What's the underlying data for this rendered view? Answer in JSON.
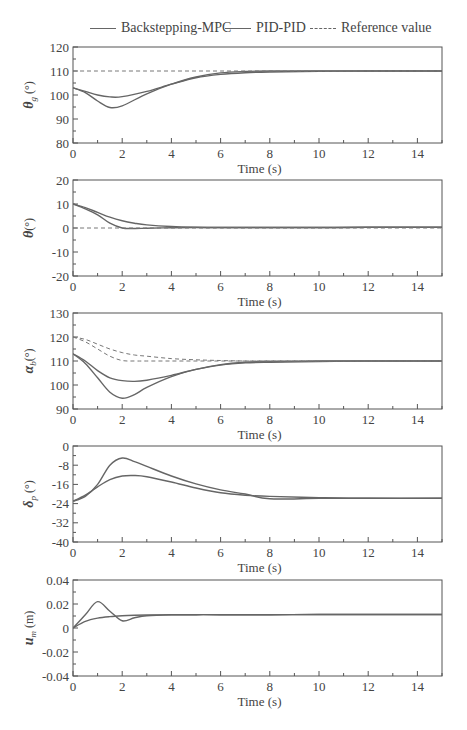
{
  "legend": {
    "items": [
      {
        "label": "Backstepping-MPC",
        "style": "solid"
      },
      {
        "label": "PID-PID",
        "style": "solid"
      },
      {
        "label": "Reference value",
        "style": "dashed"
      }
    ]
  },
  "colors": {
    "line": "#666666",
    "axis": "#555555",
    "text": "#444444"
  },
  "chart_data": [
    {
      "type": "line",
      "title": "",
      "xlabel": "Time (s)",
      "ylabel": "θg (°)",
      "xlim": [
        0,
        15
      ],
      "ylim": [
        80,
        120
      ],
      "xticks": [
        0,
        2,
        4,
        6,
        8,
        10,
        12,
        14
      ],
      "yticks": [
        80,
        90,
        100,
        110,
        120
      ],
      "grid": false,
      "x": [
        0,
        0.5,
        1,
        1.5,
        2,
        3,
        4,
        5,
        6,
        7,
        8,
        10,
        12,
        15
      ],
      "series": [
        {
          "name": "Backstepping-MPC",
          "style": "solid",
          "values": [
            103,
            101.5,
            100,
            99.2,
            99.3,
            101.5,
            104.5,
            107.2,
            108.6,
            109.3,
            109.6,
            109.9,
            110,
            110
          ]
        },
        {
          "name": "PID-PID",
          "style": "solid",
          "values": [
            103,
            101,
            97.5,
            94.8,
            95.5,
            100.5,
            104.5,
            107.5,
            109.2,
            109.8,
            110,
            110,
            110,
            110
          ]
        },
        {
          "name": "Reference value",
          "style": "dashed",
          "values": [
            110,
            110,
            110,
            110,
            110,
            110,
            110,
            110,
            110,
            110,
            110,
            110,
            110,
            110
          ]
        }
      ]
    },
    {
      "type": "line",
      "title": "",
      "xlabel": "Time (s)",
      "ylabel": "θ(°)",
      "xlim": [
        0,
        15
      ],
      "ylim": [
        -20,
        20
      ],
      "xticks": [
        0,
        2,
        4,
        6,
        8,
        10,
        12,
        14
      ],
      "yticks": [
        -20,
        -10,
        0,
        10,
        20
      ],
      "grid": false,
      "x": [
        0,
        0.5,
        1,
        1.5,
        2,
        2.5,
        3,
        4,
        5,
        6,
        8,
        10,
        12,
        15
      ],
      "series": [
        {
          "name": "Backstepping-MPC",
          "style": "solid",
          "values": [
            10,
            8.5,
            6.5,
            4.5,
            3,
            2,
            1.3,
            0.6,
            0.3,
            0.2,
            0.2,
            0.2,
            0.3,
            0.3
          ]
        },
        {
          "name": "PID-PID",
          "style": "solid",
          "values": [
            10,
            8,
            5.5,
            2,
            0,
            -0.2,
            -0.1,
            0.1,
            0.2,
            0.2,
            0.2,
            0.2,
            0.3,
            0.3
          ]
        },
        {
          "name": "Reference value",
          "style": "dashed",
          "values": [
            0,
            0,
            0,
            0,
            0,
            0,
            0,
            0,
            0,
            0,
            0,
            0,
            0,
            0
          ]
        }
      ]
    },
    {
      "type": "line",
      "title": "",
      "xlabel": "Time (s)",
      "ylabel": "αb(°)",
      "xlim": [
        0,
        15
      ],
      "ylim": [
        90,
        130
      ],
      "xticks": [
        0,
        2,
        4,
        6,
        8,
        10,
        12,
        14
      ],
      "yticks": [
        90,
        100,
        110,
        120,
        130
      ],
      "grid": false,
      "x": [
        0,
        0.5,
        1,
        1.5,
        2,
        2.5,
        3,
        4,
        5,
        6,
        7,
        8,
        10,
        12,
        15
      ],
      "series": [
        {
          "name": "Backstepping-MPC",
          "style": "solid",
          "values": [
            113,
            110,
            106,
            103,
            101.8,
            101.5,
            102,
            104,
            106.5,
            108.3,
            109.2,
            109.5,
            109.8,
            110,
            110
          ]
        },
        {
          "name": "PID-PID",
          "style": "solid",
          "values": [
            113,
            109,
            103,
            97,
            94.5,
            96,
            99,
            103.5,
            106.5,
            108.5,
            109.5,
            109.8,
            110,
            110,
            110
          ]
        },
        {
          "name": "Reference value (Backstepping-MPC)",
          "style": "dashed",
          "values": [
            120,
            119,
            117,
            115,
            113.5,
            112.5,
            112,
            111,
            110.5,
            110.2,
            110,
            110,
            110,
            110,
            110
          ]
        },
        {
          "name": "Reference value (PID-PID)",
          "style": "dashed",
          "values": [
            120,
            118,
            115,
            112,
            110.2,
            110,
            110,
            110,
            110,
            110,
            110,
            110,
            110,
            110,
            110
          ]
        }
      ]
    },
    {
      "type": "line",
      "title": "",
      "xlabel": "Time (s)",
      "ylabel": "δp (°)",
      "xlim": [
        0,
        15
      ],
      "ylim": [
        -40,
        0
      ],
      "xticks": [
        0,
        2,
        4,
        6,
        8,
        10,
        12,
        14
      ],
      "yticks": [
        -40,
        -32,
        -24,
        -16,
        -8,
        0
      ],
      "grid": false,
      "x": [
        0,
        0.5,
        1,
        1.5,
        2,
        2.5,
        3,
        4,
        5,
        6,
        7,
        8,
        10,
        12,
        15
      ],
      "series": [
        {
          "name": "Backstepping-MPC",
          "style": "solid",
          "values": [
            -23,
            -20.5,
            -17,
            -14,
            -12.5,
            -12.3,
            -12.8,
            -15,
            -17.5,
            -19.5,
            -20.5,
            -21,
            -21.5,
            -21.8,
            -21.8
          ]
        },
        {
          "name": "PID-PID",
          "style": "solid",
          "values": [
            -23,
            -21,
            -16,
            -8,
            -5,
            -6.5,
            -8.5,
            -12.5,
            -15.8,
            -18.3,
            -20,
            -22,
            -21.8,
            -21.8,
            -21.8
          ]
        }
      ]
    },
    {
      "type": "line",
      "title": "",
      "xlabel": "Time (s)",
      "ylabel": "um (m)",
      "xlim": [
        0,
        15
      ],
      "ylim": [
        -0.04,
        0.04
      ],
      "xticks": [
        0,
        2,
        4,
        6,
        8,
        10,
        12,
        14
      ],
      "yticks": [
        -0.04,
        -0.02,
        0,
        0.02,
        0.04
      ],
      "grid": false,
      "x": [
        0,
        0.5,
        1,
        1.5,
        2,
        2.5,
        3,
        4,
        5,
        6,
        8,
        10,
        12,
        15
      ],
      "series": [
        {
          "name": "Backstepping-MPC",
          "style": "solid",
          "values": [
            0,
            0.0055,
            0.0082,
            0.0095,
            0.0102,
            0.0106,
            0.0108,
            0.011,
            0.0111,
            0.0111,
            0.0111,
            0.0112,
            0.0112,
            0.0112
          ]
        },
        {
          "name": "PID-PID",
          "style": "solid",
          "values": [
            0,
            0.011,
            0.022,
            0.014,
            0.006,
            0.0085,
            0.0102,
            0.011,
            0.0111,
            0.0111,
            0.0111,
            0.0112,
            0.0112,
            0.0112
          ]
        }
      ]
    }
  ],
  "panels": [
    {
      "ylabel_main": "θ",
      "ylabel_sub": "g",
      "ylabel_unit": " (°)",
      "yticks": [
        "120",
        "110",
        "100",
        "90",
        "80"
      ],
      "xlabel": "Time (s)"
    },
    {
      "ylabel_main": "θ",
      "ylabel_sub": "",
      "ylabel_unit": "(°)",
      "yticks": [
        "20",
        "10",
        "0",
        "-10",
        "-20"
      ],
      "xlabel": "Time (s)"
    },
    {
      "ylabel_main": "α",
      "ylabel_sub": "b",
      "ylabel_unit": "(°)",
      "yticks": [
        "130",
        "120",
        "110",
        "100",
        "90"
      ],
      "xlabel": "Time (s)"
    },
    {
      "ylabel_main": "δ",
      "ylabel_sub": "p",
      "ylabel_unit": " (°)",
      "yticks": [
        "0",
        "-8",
        "-16",
        "-24",
        "-32",
        "-40"
      ],
      "xlabel": "Time (s)"
    },
    {
      "ylabel_main": "u",
      "ylabel_sub": "m",
      "ylabel_unit": " (m)",
      "yticks": [
        "0.04",
        "0.02",
        "0",
        "-0.02",
        "-0.04"
      ],
      "xlabel": "Time (s)"
    }
  ],
  "xticks": [
    "0",
    "2",
    "4",
    "6",
    "8",
    "10",
    "12",
    "14"
  ]
}
